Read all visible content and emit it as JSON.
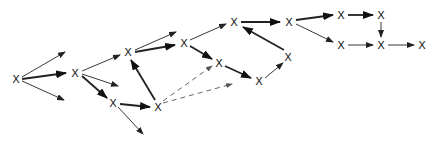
{
  "diagram": {
    "node_symbol": "X",
    "colors": {
      "stroke": "#222222",
      "dashed": "#555555",
      "background": "#ffffff"
    },
    "nodes": [
      {
        "id": "A",
        "x": 16,
        "y": 79
      },
      {
        "id": "B",
        "x": 75,
        "y": 73
      },
      {
        "id": "C",
        "x": 113,
        "y": 103
      },
      {
        "id": "D",
        "x": 158,
        "y": 107
      },
      {
        "id": "E",
        "x": 128,
        "y": 52
      },
      {
        "id": "F",
        "x": 184,
        "y": 43
      },
      {
        "id": "G",
        "x": 234,
        "y": 22
      },
      {
        "id": "H",
        "x": 289,
        "y": 22
      },
      {
        "id": "I",
        "x": 219,
        "y": 63
      },
      {
        "id": "J",
        "x": 259,
        "y": 81
      },
      {
        "id": "K",
        "x": 288,
        "y": 57
      },
      {
        "id": "L",
        "x": 341,
        "y": 15
      },
      {
        "id": "M",
        "x": 381,
        "y": 15
      },
      {
        "id": "N",
        "x": 341,
        "y": 45
      },
      {
        "id": "O",
        "x": 381,
        "y": 45
      },
      {
        "id": "P",
        "x": 422,
        "y": 45
      }
    ],
    "edges": [
      {
        "x1": 22,
        "y1": 77,
        "x2": 65,
        "y2": 52,
        "style": "thin"
      },
      {
        "x1": 22,
        "y1": 79,
        "x2": 66,
        "y2": 73,
        "style": "thick"
      },
      {
        "x1": 22,
        "y1": 81,
        "x2": 64,
        "y2": 100,
        "style": "thin"
      },
      {
        "x1": 82,
        "y1": 71,
        "x2": 120,
        "y2": 55,
        "style": "thin"
      },
      {
        "x1": 82,
        "y1": 74,
        "x2": 118,
        "y2": 86,
        "style": "thin"
      },
      {
        "x1": 82,
        "y1": 76,
        "x2": 107,
        "y2": 98,
        "style": "thick"
      },
      {
        "x1": 120,
        "y1": 104,
        "x2": 150,
        "y2": 107,
        "style": "thick"
      },
      {
        "x1": 118,
        "y1": 107,
        "x2": 143,
        "y2": 134,
        "style": "thin"
      },
      {
        "x1": 155,
        "y1": 100,
        "x2": 131,
        "y2": 60,
        "style": "thick"
      },
      {
        "x1": 135,
        "y1": 50,
        "x2": 176,
        "y2": 32,
        "style": "thin"
      },
      {
        "x1": 135,
        "y1": 52,
        "x2": 175,
        "y2": 45,
        "style": "thick"
      },
      {
        "x1": 190,
        "y1": 40,
        "x2": 226,
        "y2": 24,
        "style": "thin"
      },
      {
        "x1": 190,
        "y1": 46,
        "x2": 212,
        "y2": 59,
        "style": "thick"
      },
      {
        "x1": 241,
        "y1": 22,
        "x2": 280,
        "y2": 22,
        "style": "thick"
      },
      {
        "x1": 225,
        "y1": 66,
        "x2": 251,
        "y2": 78,
        "style": "thick"
      },
      {
        "x1": 265,
        "y1": 78,
        "x2": 283,
        "y2": 63,
        "style": "thin"
      },
      {
        "x1": 284,
        "y1": 50,
        "x2": 243,
        "y2": 27,
        "style": "thick"
      },
      {
        "x1": 296,
        "y1": 20,
        "x2": 333,
        "y2": 15,
        "style": "thick"
      },
      {
        "x1": 296,
        "y1": 24,
        "x2": 333,
        "y2": 42,
        "style": "thin"
      },
      {
        "x1": 348,
        "y1": 15,
        "x2": 373,
        "y2": 15,
        "style": "thick"
      },
      {
        "x1": 381,
        "y1": 22,
        "x2": 381,
        "y2": 37,
        "style": "thin"
      },
      {
        "x1": 348,
        "y1": 45,
        "x2": 373,
        "y2": 45,
        "style": "thin"
      },
      {
        "x1": 388,
        "y1": 45,
        "x2": 414,
        "y2": 45,
        "style": "thin"
      },
      {
        "x1": 163,
        "y1": 101,
        "x2": 212,
        "y2": 66,
        "style": "dashed"
      },
      {
        "x1": 163,
        "y1": 103,
        "x2": 232,
        "y2": 84,
        "style": "dashed"
      }
    ]
  }
}
